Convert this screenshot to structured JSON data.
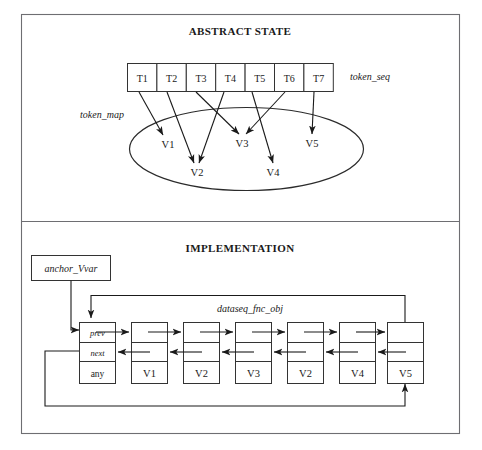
{
  "figure": {
    "width": 482,
    "height": 450,
    "background": "#ffffff",
    "stroke_color": "#1a1a1a",
    "frame_color": "#6e6e72"
  },
  "panels": [
    {
      "id": "abstract-state",
      "title": "ABSTRACT STATE"
    },
    {
      "id": "implementation",
      "title": "IMPLEMENTATION"
    }
  ],
  "abstract_state": {
    "title": "ABSTRACT STATE",
    "token_seq_label": "token_seq",
    "token_map_label": "token_map",
    "tokens": [
      {
        "label": "T1"
      },
      {
        "label": "T2"
      },
      {
        "label": "T3"
      },
      {
        "label": "T4"
      },
      {
        "label": "T5"
      },
      {
        "label": "T6"
      },
      {
        "label": "T7"
      }
    ],
    "values": [
      {
        "label": "V1"
      },
      {
        "label": "V2"
      },
      {
        "label": "V3"
      },
      {
        "label": "V4"
      },
      {
        "label": "V5"
      }
    ],
    "token_map_edges": [
      {
        "from": "T1",
        "to": "V1"
      },
      {
        "from": "T2",
        "to": "V2"
      },
      {
        "from": "T3",
        "to": "V3"
      },
      {
        "from": "T4",
        "to": "V2"
      },
      {
        "from": "T5",
        "to": "V4"
      },
      {
        "from": "T6",
        "to": "V3"
      },
      {
        "from": "T7",
        "to": "V5"
      }
    ]
  },
  "implementation": {
    "title": "IMPLEMENTATION",
    "anchor_box_label": "anchor_Vvar",
    "dataseq_label": "dataseq_fnc_obj",
    "anchor_node": {
      "prev_label": "prev",
      "next_label": "next",
      "value_label": "any"
    },
    "nodes": [
      {
        "value_label": "V1"
      },
      {
        "value_label": "V2"
      },
      {
        "value_label": "V3"
      },
      {
        "value_label": "V2"
      },
      {
        "value_label": "V4"
      },
      {
        "value_label": "V3"
      },
      {
        "value_label": "V5"
      }
    ]
  }
}
